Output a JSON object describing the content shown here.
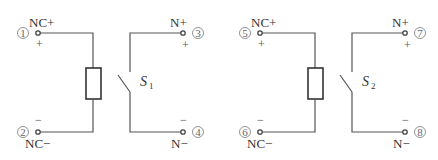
{
  "diagram": {
    "circuits": [
      {
        "id": "circuit-1",
        "switch_label": "S",
        "switch_subscript": "1",
        "terminals": {
          "nc_plus": {
            "number": "1",
            "label": "NC+",
            "polarity": "+"
          },
          "nc_minus": {
            "number": "2",
            "label": "NC−",
            "polarity": "−"
          },
          "n_plus": {
            "number": "3",
            "label": "N+",
            "polarity": "+"
          },
          "n_minus": {
            "number": "4",
            "label": "N−",
            "polarity": "−"
          }
        }
      },
      {
        "id": "circuit-2",
        "switch_label": "S",
        "switch_subscript": "2",
        "terminals": {
          "nc_plus": {
            "number": "5",
            "label": "NC+",
            "polarity": "+"
          },
          "nc_minus": {
            "number": "6",
            "label": "NC−",
            "polarity": "−"
          },
          "n_plus": {
            "number": "7",
            "label": "N+",
            "polarity": "+"
          },
          "n_minus": {
            "number": "8",
            "label": "N−",
            "polarity": "−"
          }
        }
      }
    ],
    "colors": {
      "wire": "#555555",
      "component": "#333333",
      "background": "#ffffff"
    }
  }
}
